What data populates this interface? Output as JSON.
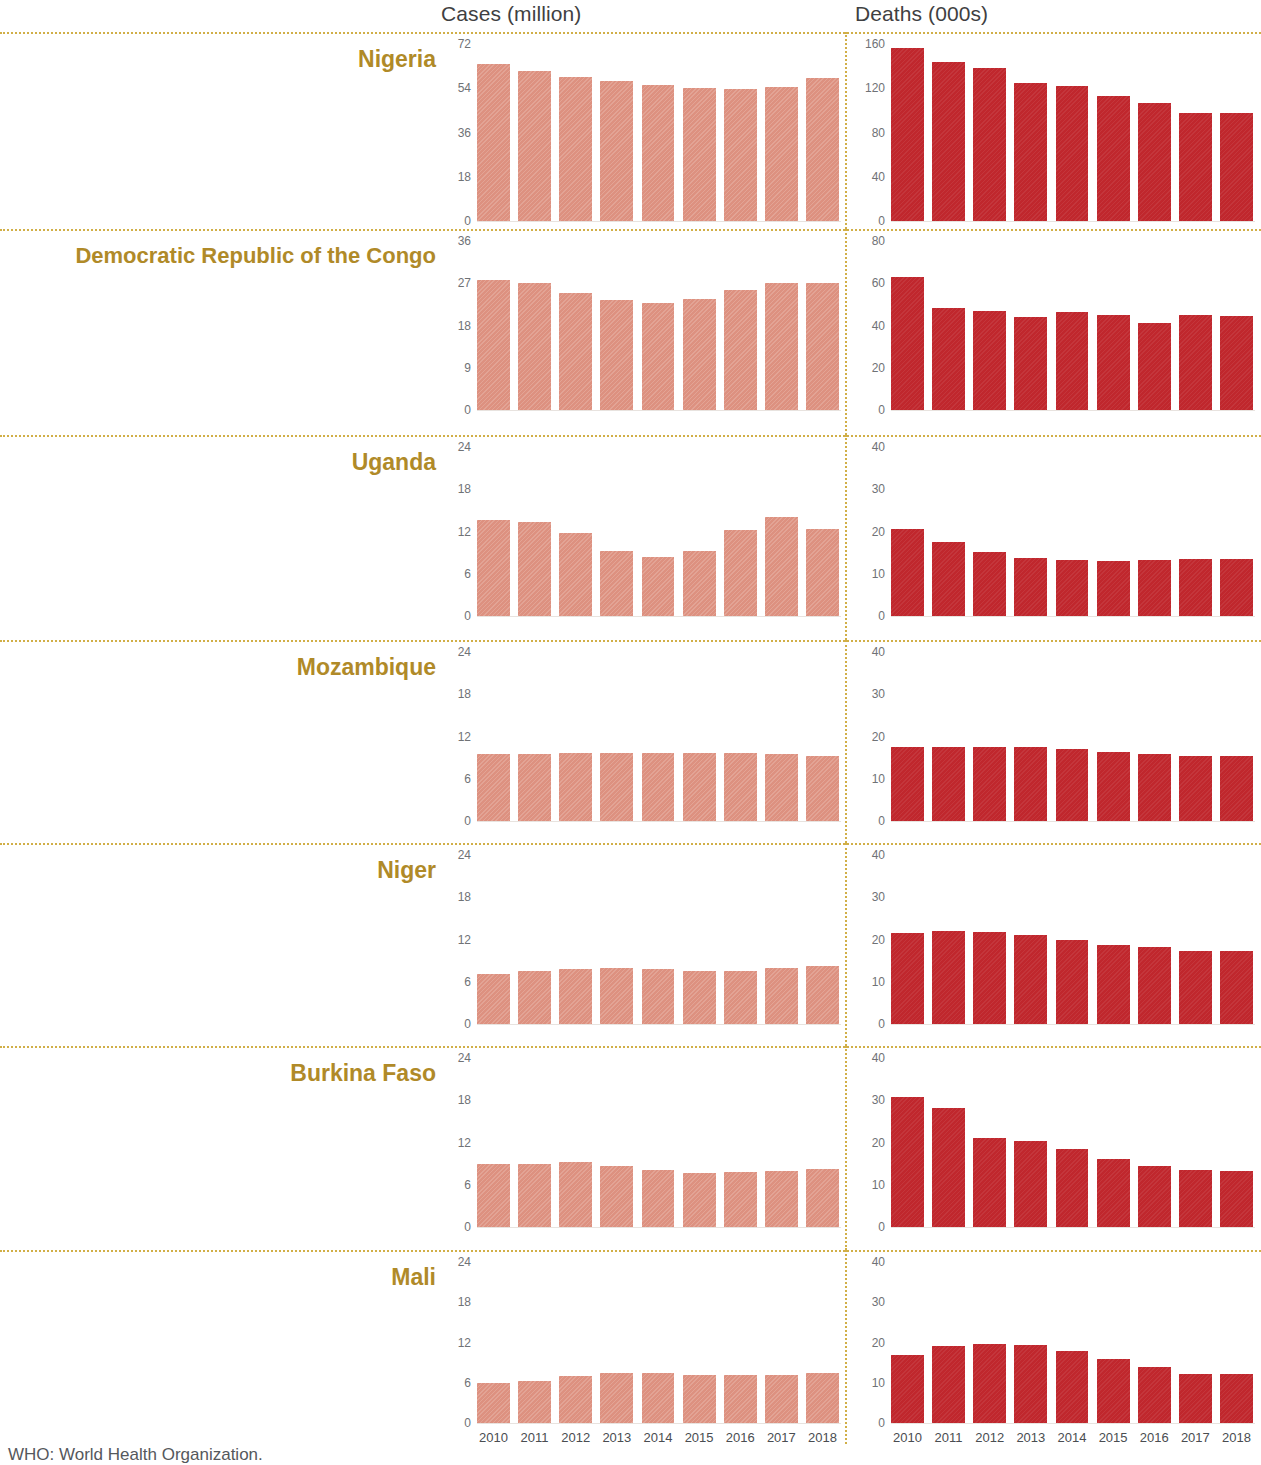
{
  "headers": {
    "cases": "Cases (million)",
    "deaths": "Deaths (000s)"
  },
  "footnote": "WHO: World Health Organization.",
  "colors": {
    "cases_bar": "#dd9180",
    "deaths_bar": "#c0272d",
    "country_label": "#b08a28",
    "separator": "#c9a227",
    "tick_text": "#6f7276",
    "header_text": "#3f3f42"
  },
  "years": [
    "2010",
    "2011",
    "2012",
    "2013",
    "2014",
    "2015",
    "2016",
    "2017",
    "2018"
  ],
  "countries": [
    {
      "name": "Nigeria"
    },
    {
      "name": "Democratic Republic of the Congo"
    },
    {
      "name": "Uganda"
    },
    {
      "name": "Mozambique"
    },
    {
      "name": "Niger"
    },
    {
      "name": "Burkina Faso"
    },
    {
      "name": "Mali"
    }
  ],
  "chart_data": {
    "type": "bar",
    "title": "",
    "xlabel": "",
    "x": [
      "2010",
      "2011",
      "2012",
      "2013",
      "2014",
      "2015",
      "2016",
      "2017",
      "2018"
    ],
    "grid": false,
    "legend": "none",
    "panels": [
      {
        "country": "Nigeria",
        "metric": "Cases (million)",
        "ylabel": "Cases (million)",
        "ylim": [
          0,
          72
        ],
        "yticks": [
          72,
          54,
          36,
          18,
          0
        ],
        "values": [
          64.0,
          61.0,
          58.5,
          57.0,
          55.5,
          54.0,
          53.5,
          54.5,
          58.0
        ]
      },
      {
        "country": "Nigeria",
        "metric": "Deaths (000s)",
        "ylabel": "Deaths (000s)",
        "ylim": [
          0,
          160
        ],
        "yticks": [
          160,
          120,
          80,
          40,
          0
        ],
        "values": [
          156.0,
          144.0,
          138.0,
          125.0,
          122.0,
          113.0,
          107.0,
          98.0,
          98.0
        ]
      },
      {
        "country": "Democratic Republic of the Congo",
        "metric": "Cases (million)",
        "ylabel": "Cases (million)",
        "ylim": [
          0,
          36
        ],
        "yticks": [
          36,
          27,
          18,
          9,
          0
        ],
        "values": [
          27.6,
          27.0,
          25.0,
          23.4,
          22.8,
          23.7,
          25.5,
          27.1,
          27.0
        ]
      },
      {
        "country": "Democratic Republic of the Congo",
        "metric": "Deaths (000s)",
        "ylabel": "Deaths (000s)",
        "ylim": [
          0,
          80
        ],
        "yticks": [
          80,
          60,
          40,
          20,
          0
        ],
        "values": [
          63.0,
          48.5,
          47.0,
          44.0,
          46.5,
          45.0,
          41.0,
          45.0,
          44.5
        ]
      },
      {
        "country": "Uganda",
        "metric": "Cases (million)",
        "ylabel": "Cases (million)",
        "ylim": [
          0,
          24
        ],
        "yticks": [
          24,
          18,
          12,
          6,
          0
        ],
        "values": [
          13.6,
          13.3,
          11.8,
          9.3,
          8.4,
          9.3,
          12.2,
          14.0,
          12.4
        ]
      },
      {
        "country": "Uganda",
        "metric": "Deaths (000s)",
        "ylabel": "Deaths (000s)",
        "ylim": [
          0,
          40
        ],
        "yticks": [
          40,
          30,
          20,
          10,
          0
        ],
        "values": [
          20.6,
          17.5,
          15.2,
          13.7,
          13.3,
          13.0,
          13.2,
          13.4,
          13.4
        ]
      },
      {
        "country": "Mozambique",
        "metric": "Cases (million)",
        "ylabel": "Cases (million)",
        "ylim": [
          0,
          24
        ],
        "yticks": [
          24,
          18,
          12,
          6,
          0
        ],
        "values": [
          9.5,
          9.5,
          9.6,
          9.7,
          9.7,
          9.7,
          9.7,
          9.5,
          9.2
        ]
      },
      {
        "country": "Mozambique",
        "metric": "Deaths (000s)",
        "ylabel": "Deaths (000s)",
        "ylim": [
          0,
          40
        ],
        "yticks": [
          40,
          30,
          20,
          10,
          0
        ],
        "values": [
          17.5,
          17.6,
          17.6,
          17.5,
          17.1,
          16.3,
          15.9,
          15.3,
          15.3
        ]
      },
      {
        "country": "Niger",
        "metric": "Cases (million)",
        "ylabel": "Cases (million)",
        "ylim": [
          0,
          24
        ],
        "yticks": [
          24,
          18,
          12,
          6,
          0
        ],
        "values": [
          7.1,
          7.5,
          7.8,
          7.9,
          7.8,
          7.5,
          7.5,
          7.9,
          8.2
        ]
      },
      {
        "country": "Niger",
        "metric": "Deaths (000s)",
        "ylabel": "Deaths (000s)",
        "ylim": [
          0,
          40
        ],
        "yticks": [
          40,
          30,
          20,
          10,
          0
        ],
        "values": [
          21.5,
          22.0,
          21.7,
          21.0,
          19.9,
          18.6,
          18.3,
          17.4,
          17.3
        ]
      },
      {
        "country": "Burkina Faso",
        "metric": "Cases (million)",
        "ylabel": "Cases (million)",
        "ylim": [
          0,
          24
        ],
        "yticks": [
          24,
          18,
          12,
          6,
          0
        ],
        "values": [
          8.9,
          9.0,
          9.2,
          8.7,
          8.1,
          7.6,
          7.8,
          8.0,
          8.2
        ]
      },
      {
        "country": "Burkina Faso",
        "metric": "Deaths (000s)",
        "ylabel": "Deaths (000s)",
        "ylim": [
          0,
          40
        ],
        "yticks": [
          40,
          30,
          20,
          10,
          0
        ],
        "values": [
          30.8,
          28.2,
          21.1,
          20.3,
          18.4,
          16.2,
          14.4,
          13.5,
          13.2
        ]
      },
      {
        "country": "Mali",
        "metric": "Cases (million)",
        "ylabel": "Cases (million)",
        "ylim": [
          0,
          24
        ],
        "yticks": [
          24,
          18,
          12,
          6,
          0
        ],
        "values": [
          6.0,
          6.3,
          7.0,
          7.4,
          7.4,
          7.1,
          7.1,
          7.2,
          7.4
        ]
      },
      {
        "country": "Mali",
        "metric": "Deaths (000s)",
        "ylabel": "Deaths (000s)",
        "ylim": [
          0,
          40
        ],
        "yticks": [
          40,
          30,
          20,
          10,
          0
        ],
        "values": [
          17.0,
          19.1,
          19.6,
          19.4,
          17.8,
          15.8,
          13.9,
          12.2,
          12.1
        ]
      }
    ]
  }
}
